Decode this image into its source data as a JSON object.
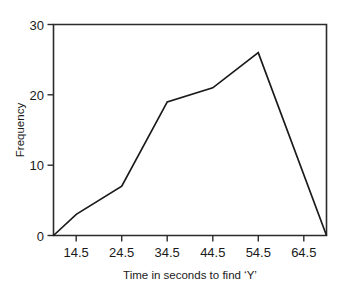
{
  "chart_data": {
    "type": "line",
    "title": "",
    "subtitle": "",
    "xlabel": "Time in seconds to find ‘Y’",
    "ylabel": "Frequency",
    "x": [
      9.5,
      14.5,
      24.5,
      34.5,
      44.5,
      54.5,
      69.5
    ],
    "values": [
      0,
      3,
      7,
      19,
      21,
      26,
      0
    ],
    "series": [
      {
        "name": "Frequency",
        "values": [
          0,
          3,
          7,
          19,
          21,
          26,
          0
        ]
      }
    ],
    "xlim": [
      9.5,
      69.5
    ],
    "ylim": [
      0,
      30
    ],
    "x_tick_values": [
      14.5,
      24.5,
      34.5,
      44.5,
      54.5,
      64.5
    ],
    "x_tick_labels": [
      "14.5",
      "24.5",
      "34.5",
      "44.5",
      "54.5",
      "64.5"
    ],
    "y_tick_values": [
      0,
      10,
      20,
      30
    ],
    "y_tick_labels": [
      "0",
      "10",
      "20",
      "30"
    ],
    "grid": false,
    "legend": false,
    "legend_position": "none",
    "line_color": "#1a1a1a",
    "frame_color": "#2b2b2b",
    "background_color": "#ffffff",
    "annotations": []
  },
  "axes": {
    "y_title": "Frequency",
    "x_title": "Time in seconds to find ‘Y’",
    "y_labels": {
      "0": "0",
      "1": "10",
      "2": "20",
      "3": "30"
    },
    "x_labels": {
      "0": "14.5",
      "1": "24.5",
      "2": "34.5",
      "3": "44.5",
      "4": "54.5",
      "5": "64.5"
    }
  }
}
